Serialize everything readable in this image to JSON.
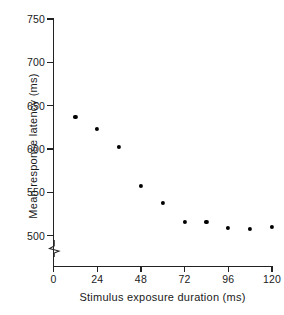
{
  "chart_data": {
    "type": "scatter",
    "title": "",
    "xlabel": "Stimulus exposure duration (ms)",
    "ylabel": "Mean response latency (ms)",
    "xlim": [
      0,
      120
    ],
    "ylim": [
      500,
      750
    ],
    "xticks": [
      "0",
      "24",
      "48",
      "72",
      "96",
      "120"
    ],
    "xtick_values": [
      0,
      24,
      48,
      72,
      96,
      120
    ],
    "yticks": [
      "500",
      "550",
      "600",
      "650",
      "700",
      "750"
    ],
    "ytick_values": [
      500,
      550,
      600,
      650,
      700,
      750
    ],
    "grid": false,
    "legend": null,
    "axis_break": "y-axis broken below 500",
    "marker": "filled-circle",
    "marker_color": "#000000",
    "x": [
      12,
      24,
      36,
      48,
      60,
      72,
      84,
      96,
      108,
      120
    ],
    "values": [
      637,
      623,
      602,
      557,
      538,
      516,
      516,
      509,
      508,
      510
    ],
    "points": [
      {
        "x": 12,
        "y": 637
      },
      {
        "x": 24,
        "y": 623
      },
      {
        "x": 36,
        "y": 602
      },
      {
        "x": 48,
        "y": 557
      },
      {
        "x": 60,
        "y": 538
      },
      {
        "x": 72,
        "y": 516
      },
      {
        "x": 84,
        "y": 516
      },
      {
        "x": 96,
        "y": 509
      },
      {
        "x": 108,
        "y": 508
      },
      {
        "x": 120,
        "y": 510
      }
    ]
  }
}
